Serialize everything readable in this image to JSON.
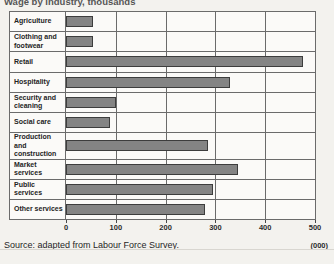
{
  "chart_title": "Wage by industry, thousands",
  "source_note": "Source: adapted from Labour Force Survey.",
  "unit_label": "(000)",
  "axis": {
    "ticks": [
      "0",
      "100",
      "200",
      "300",
      "400",
      "500"
    ]
  },
  "chart_data": {
    "type": "bar",
    "orientation": "horizontal",
    "title": "Wage by industry, thousands",
    "xlabel": "(000)",
    "ylabel": "",
    "xlim": [
      0,
      500
    ],
    "grid": true,
    "legend": "none",
    "categories": [
      "Agriculture",
      "Clothing and footwear",
      "Retail",
      "Hospitality",
      "Security and cleaning",
      "Social care",
      "Production and construction",
      "Market services",
      "Public services",
      "Other services"
    ],
    "values": [
      55,
      55,
      475,
      330,
      100,
      88,
      285,
      345,
      295,
      280
    ],
    "xticks": [
      0,
      100,
      200,
      300,
      400,
      500
    ],
    "bar_color": "#848484",
    "bar_border_color": "#3d3d3d",
    "source": "Source: adapted from Labour Force Survey."
  }
}
